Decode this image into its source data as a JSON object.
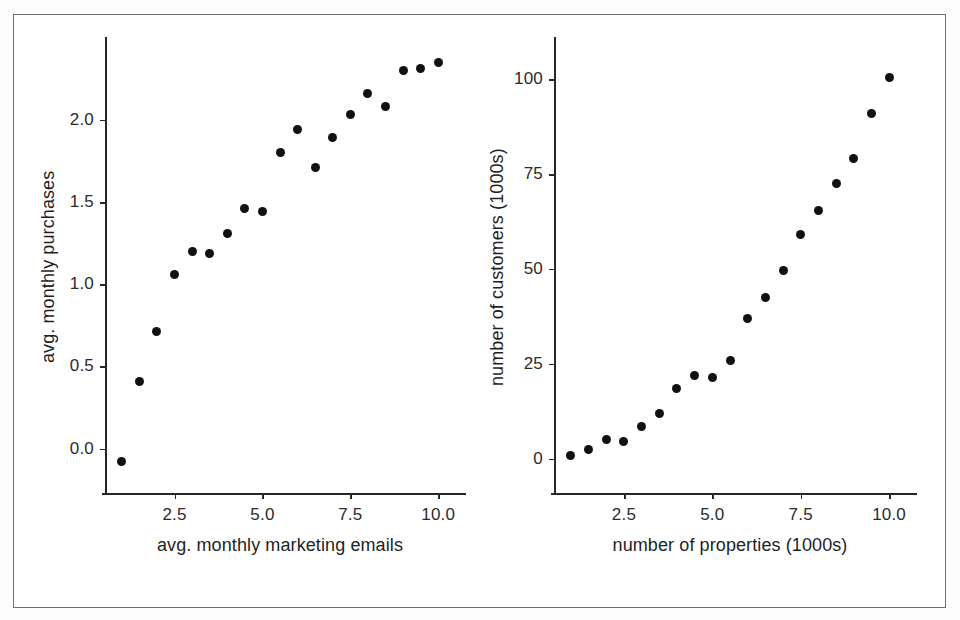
{
  "figure": {
    "background_color": "#ffffff",
    "frame_color": "#6d6f70",
    "marker_color": "#111111",
    "axis_color": "#262626"
  },
  "chart_data": [
    {
      "type": "scatter",
      "panel": "left",
      "title": "",
      "xlabel": "avg. monthly marketing emails",
      "ylabel": "avg. monthly purchases",
      "xlim": [
        0.55,
        10.45
      ],
      "ylim": [
        -0.27,
        2.48
      ],
      "xticks": [
        2.5,
        5.0,
        7.5,
        10.0
      ],
      "xticklabels": [
        "2.5",
        "5.0",
        "7.5",
        "10.0"
      ],
      "yticks": [
        0.0,
        0.5,
        1.0,
        1.5,
        2.0
      ],
      "yticklabels": [
        "0.0",
        "0.5",
        "1.0",
        "1.5",
        "2.0"
      ],
      "grid": false,
      "legend": false,
      "x": [
        1.0,
        1.5,
        2.0,
        2.5,
        3.0,
        3.5,
        4.0,
        4.5,
        5.0,
        5.5,
        6.0,
        6.5,
        7.0,
        7.5,
        8.0,
        8.5,
        9.0,
        9.5,
        10.0
      ],
      "y": [
        -0.08,
        0.41,
        0.71,
        1.06,
        1.2,
        1.19,
        1.31,
        1.46,
        1.44,
        1.8,
        1.94,
        1.71,
        1.89,
        2.03,
        2.16,
        2.08,
        2.3,
        2.31,
        2.35
      ]
    },
    {
      "type": "scatter",
      "panel": "right",
      "title": "",
      "xlabel": "number of properties (1000s)",
      "ylabel": "number of customers (1000s)",
      "xlim": [
        0.55,
        10.45
      ],
      "ylim": [
        -9,
        110
      ],
      "xticks": [
        2.5,
        5.0,
        7.5,
        10.0
      ],
      "xticklabels": [
        "2.5",
        "5.0",
        "7.5",
        "10.0"
      ],
      "yticks": [
        0,
        25,
        50,
        75,
        100
      ],
      "yticklabels": [
        "0",
        "25",
        "50",
        "75",
        "100"
      ],
      "grid": false,
      "legend": false,
      "x": [
        1.0,
        1.5,
        2.0,
        2.5,
        3.0,
        3.5,
        4.0,
        4.5,
        5.0,
        5.5,
        6.0,
        6.5,
        7.0,
        7.5,
        8.0,
        8.5,
        9.0,
        9.5,
        10.0
      ],
      "y": [
        1,
        2.5,
        5,
        4.5,
        8.5,
        12,
        18.5,
        22,
        21.5,
        26,
        37,
        42.5,
        49.5,
        59,
        65.5,
        72.5,
        79,
        91,
        100.5
      ]
    }
  ]
}
